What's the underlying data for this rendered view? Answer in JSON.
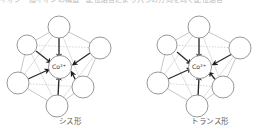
{
  "page": {
    "background_color": "#ffffff",
    "ink_color": "#2b2b2b",
    "clipped_header_text": "イオン　錯イオンの構造　配位結合により六つの方向を向く配位結合"
  },
  "figures": [
    {
      "id": "cis",
      "caption": "シス形",
      "center": {
        "element": "Co",
        "charge": "3+",
        "label": "Co",
        "superscript": "3+"
      },
      "geometry": "octahedral",
      "ligand_count": 6,
      "bond_type": "coordinate-covalent-arrow",
      "vertices": [
        {
          "name": "top",
          "cx": 59,
          "cy": 20,
          "r": 11
        },
        {
          "name": "upper-left",
          "cx": 27,
          "cy": 38,
          "r": 10
        },
        {
          "name": "right",
          "cx": 100,
          "cy": 41,
          "r": 11
        },
        {
          "name": "lower-left",
          "cx": 18,
          "cy": 76,
          "r": 11
        },
        {
          "name": "lower-right",
          "cx": 83,
          "cy": 80,
          "r": 11
        },
        {
          "name": "bottom",
          "cx": 57,
          "cy": 99,
          "r": 11
        }
      ]
    },
    {
      "id": "trans",
      "caption": "トランス形",
      "center": {
        "element": "Co",
        "charge": "3+",
        "label": "Co",
        "superscript": "3+"
      },
      "geometry": "octahedral",
      "ligand_count": 6,
      "bond_type": "coordinate-covalent-arrow",
      "vertices": [
        {
          "name": "top",
          "cx": 59,
          "cy": 20,
          "r": 11
        },
        {
          "name": "upper-left",
          "cx": 27,
          "cy": 38,
          "r": 10
        },
        {
          "name": "right",
          "cx": 100,
          "cy": 41,
          "r": 11
        },
        {
          "name": "lower-left",
          "cx": 18,
          "cy": 76,
          "r": 11
        },
        {
          "name": "lower-right",
          "cx": 83,
          "cy": 80,
          "r": 11
        },
        {
          "name": "bottom",
          "cx": 57,
          "cy": 99,
          "r": 11
        }
      ]
    }
  ]
}
